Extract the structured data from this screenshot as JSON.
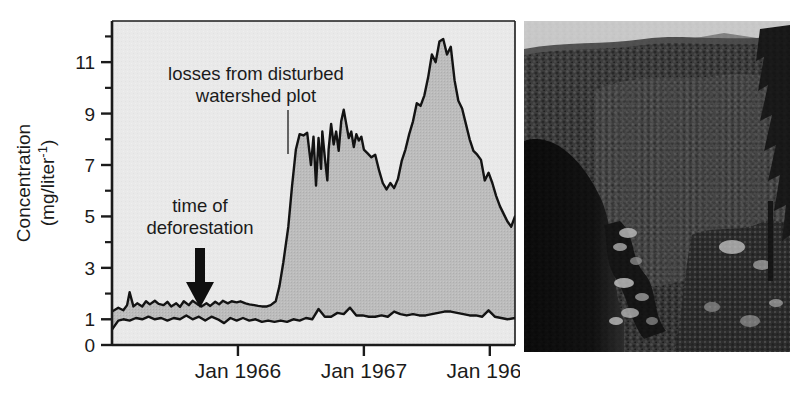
{
  "figure": {
    "panel_a_name": "nutrient-concentration-chart",
    "panel_b_name": "watershed-photograph"
  },
  "axes": {
    "y_title_line1": "Concentration",
    "y_title_line2": "(mg/liter",
    "y_title_exponent": "-1",
    "y_title_close": ")",
    "y_ticks": [
      "0",
      "1",
      "3",
      "5",
      "7",
      "9",
      "11"
    ],
    "x_ticks": [
      "Jan 1966",
      "Jan 1967",
      "Jan 1968"
    ]
  },
  "annotations": {
    "disturbed_line1": "losses from disturbed",
    "disturbed_line2": "watershed plot",
    "deforestation_line1": "time of",
    "deforestation_line2": "deforestation",
    "arrow_icon": "down-arrow-icon"
  },
  "colors": {
    "plot_background": "#e9e9e9",
    "fill_grey": "#b9b9b9",
    "curve_black": "#131313",
    "axis_black": "#1b1b1b",
    "page_background": "#ffffff",
    "photo_dark": "#0c0c0c",
    "photo_light": "#d8d8d8"
  },
  "chart_data": {
    "type": "area",
    "title": "",
    "xlabel": "",
    "ylabel": "Concentration (mg/liter-1)",
    "ylim": [
      0,
      12.6
    ],
    "xlim": [
      1965.0,
      1968.2
    ],
    "grid": false,
    "legend": "none",
    "x_tick_values": [
      1966.0,
      1967.0,
      1968.0
    ],
    "x_tick_labels": [
      "Jan 1966",
      "Jan 1967",
      "Jan 1968"
    ],
    "y_tick_values": [
      0,
      1,
      3,
      5,
      7,
      9,
      11
    ],
    "y_minor_tick_values": [
      2,
      4,
      6,
      8,
      10,
      12
    ],
    "annotations": [
      {
        "text": "losses from disturbed watershed plot",
        "x": 1966.5,
        "y": 11.2,
        "leader_to_x": 1966.68,
        "leader_to_y": 8.6
      },
      {
        "text": "time of deforestation",
        "x": 1965.7,
        "y": 6.0
      },
      {
        "text": "deforestation arrow",
        "x": 1965.75,
        "y": 4.2,
        "type": "arrow-down"
      }
    ],
    "series": [
      {
        "name": "disturbed watershed plot",
        "role": "upper-boundary",
        "x": [
          1965.0,
          1965.05,
          1965.09,
          1965.12,
          1965.14,
          1965.17,
          1965.2,
          1965.24,
          1965.27,
          1965.3,
          1965.34,
          1965.37,
          1965.41,
          1965.44,
          1965.47,
          1965.51,
          1965.54,
          1965.57,
          1965.61,
          1965.64,
          1965.68,
          1965.71,
          1965.75,
          1965.78,
          1965.82,
          1965.85,
          1965.88,
          1965.92,
          1965.95,
          1965.99,
          1966.02,
          1966.06,
          1966.09,
          1966.13,
          1966.16,
          1966.19,
          1966.23,
          1966.26,
          1966.3,
          1966.33,
          1966.36,
          1966.4,
          1966.43,
          1966.46,
          1966.49,
          1966.52,
          1966.55,
          1966.58,
          1966.6,
          1966.62,
          1966.64,
          1966.66,
          1966.67,
          1966.69,
          1966.71,
          1966.72,
          1966.74,
          1966.76,
          1966.78,
          1966.8,
          1966.82,
          1966.84,
          1966.86,
          1966.88,
          1966.9,
          1966.92,
          1966.94,
          1966.96,
          1966.98,
          1967.0,
          1967.03,
          1967.06,
          1967.09,
          1967.12,
          1967.15,
          1967.18,
          1967.21,
          1967.24,
          1967.27,
          1967.3,
          1967.33,
          1967.36,
          1967.39,
          1967.42,
          1967.45,
          1967.48,
          1967.51,
          1967.54,
          1967.57,
          1967.6,
          1967.63,
          1967.66,
          1967.69,
          1967.72,
          1967.75,
          1967.78,
          1967.81,
          1967.84,
          1967.87,
          1967.9,
          1967.93,
          1967.96,
          1967.99,
          1968.02,
          1968.05,
          1968.08,
          1968.11,
          1968.14,
          1968.17,
          1968.2
        ],
        "y": [
          1.3,
          1.45,
          1.35,
          1.55,
          2.05,
          1.5,
          1.62,
          1.5,
          1.7,
          1.58,
          1.72,
          1.6,
          1.55,
          1.68,
          1.5,
          1.62,
          1.48,
          1.7,
          1.55,
          1.72,
          1.58,
          1.5,
          1.62,
          1.52,
          1.68,
          1.58,
          1.72,
          1.62,
          1.7,
          1.66,
          1.7,
          1.62,
          1.58,
          1.55,
          1.52,
          1.5,
          1.5,
          1.55,
          1.7,
          2.3,
          3.2,
          4.6,
          6.2,
          7.6,
          8.2,
          8.15,
          8.25,
          7.0,
          8.1,
          6.2,
          8.05,
          6.85,
          8.3,
          7.3,
          6.4,
          7.6,
          8.6,
          7.8,
          8.3,
          7.55,
          8.7,
          9.15,
          8.6,
          8.05,
          8.3,
          7.7,
          8.2,
          7.95,
          8.1,
          7.6,
          7.45,
          7.3,
          7.4,
          6.8,
          6.3,
          6.05,
          6.3,
          6.1,
          6.45,
          7.15,
          7.6,
          8.2,
          8.7,
          9.4,
          9.3,
          9.7,
          10.4,
          11.3,
          11.0,
          11.8,
          11.9,
          11.3,
          11.6,
          10.3,
          9.5,
          9.2,
          8.6,
          8.0,
          7.55,
          7.4,
          7.2,
          6.4,
          6.7,
          6.3,
          5.8,
          5.4,
          5.1,
          4.8,
          4.6,
          5.0
        ]
      },
      {
        "name": "undisturbed reference watershed",
        "role": "lower-boundary",
        "x": [
          1965.0,
          1965.05,
          1965.09,
          1965.14,
          1965.19,
          1965.24,
          1965.29,
          1965.34,
          1965.39,
          1965.44,
          1965.49,
          1965.54,
          1965.59,
          1965.64,
          1965.69,
          1965.74,
          1965.79,
          1965.84,
          1965.89,
          1965.94,
          1965.99,
          1966.04,
          1966.09,
          1966.14,
          1966.19,
          1966.24,
          1966.29,
          1966.34,
          1966.39,
          1966.44,
          1966.49,
          1966.54,
          1966.59,
          1966.64,
          1966.69,
          1966.74,
          1966.79,
          1966.84,
          1966.89,
          1966.94,
          1966.99,
          1967.04,
          1967.09,
          1967.14,
          1967.19,
          1967.24,
          1967.29,
          1967.34,
          1967.39,
          1967.44,
          1967.49,
          1967.54,
          1967.59,
          1967.64,
          1967.69,
          1967.74,
          1967.79,
          1967.84,
          1967.89,
          1967.94,
          1967.99,
          1968.04,
          1968.09,
          1968.14,
          1968.2
        ],
        "y": [
          0.6,
          0.95,
          1.0,
          0.95,
          1.05,
          1.0,
          1.1,
          1.0,
          1.05,
          0.95,
          1.05,
          1.0,
          1.15,
          1.0,
          1.1,
          0.95,
          1.1,
          1.0,
          0.85,
          1.05,
          0.95,
          1.05,
          0.95,
          1.0,
          0.9,
          0.95,
          0.9,
          0.95,
          0.9,
          1.0,
          0.95,
          1.05,
          1.0,
          1.4,
          1.1,
          1.1,
          1.25,
          1.2,
          1.45,
          1.15,
          1.15,
          1.1,
          1.1,
          1.15,
          1.1,
          1.3,
          1.2,
          1.15,
          1.2,
          1.15,
          1.15,
          1.2,
          1.25,
          1.3,
          1.3,
          1.25,
          1.2,
          1.15,
          1.15,
          1.1,
          1.35,
          1.1,
          1.05,
          1.0,
          1.05
        ]
      }
    ]
  }
}
